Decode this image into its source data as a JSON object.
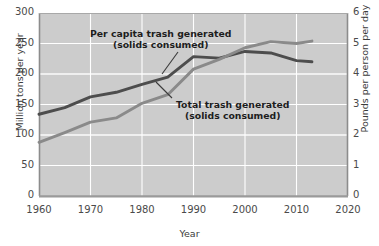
{
  "chart_data": {
    "type": "line",
    "title": "",
    "xlabel": "Year",
    "ylabel": "Million tons per year",
    "ylabel_right": "Pounds per person per day",
    "xlim": [
      1960,
      2020
    ],
    "ylim": [
      0,
      300
    ],
    "ylim_right": [
      0,
      6
    ],
    "xticks": [
      1960,
      1970,
      1980,
      1990,
      2000,
      2010,
      2020
    ],
    "yticks_left": [
      0,
      50,
      100,
      150,
      200,
      250,
      300
    ],
    "yticks_right": [
      0,
      1,
      2,
      3,
      4,
      5,
      6
    ],
    "grid": true,
    "legend": "inline-annotations",
    "series": [
      {
        "name": "Per capita trash generated (solids consumed)",
        "axis": "right",
        "unit": "Pounds per person per day",
        "color": "#4d4d4d",
        "x": [
          1960,
          1965,
          1970,
          1975,
          1980,
          1985,
          1990,
          1995,
          2000,
          2005,
          2010,
          2013
        ],
        "values": [
          2.68,
          2.9,
          3.25,
          3.4,
          3.66,
          3.9,
          4.57,
          4.52,
          4.74,
          4.69,
          4.44,
          4.4
        ]
      },
      {
        "name": "Total trash generated (solids consumed)",
        "axis": "left",
        "unit": "Million tons per year",
        "color": "#8a8a8a",
        "x": [
          1960,
          1965,
          1970,
          1975,
          1980,
          1985,
          1990,
          1995,
          2000,
          2005,
          2010,
          2013
        ],
        "values": [
          88,
          104,
          121,
          128,
          152,
          166,
          208,
          224,
          243,
          253,
          250,
          254
        ]
      }
    ],
    "annotations": [
      {
        "id": "per-capita-annotation",
        "line1": "Per capita trash generated",
        "line2": "(solids consumed)",
        "x": 90,
        "y": 28,
        "leader": {
          "x1": 178,
          "y1": 52,
          "x2": 162,
          "y2": 74
        }
      },
      {
        "id": "total-trash-annotation",
        "line1": "Total trash generated",
        "line2": "(solids consumed)",
        "x": 176,
        "y": 99,
        "leader": {
          "x1": 172,
          "y1": 98,
          "x2": 156,
          "y2": 82
        }
      }
    ],
    "style": {
      "plot_background": "#cccccc",
      "grid_color": "#ffffff",
      "axis_color": "#7a7a7a",
      "page_background": "#ffffff",
      "text_color": "#3b3b3b"
    }
  }
}
